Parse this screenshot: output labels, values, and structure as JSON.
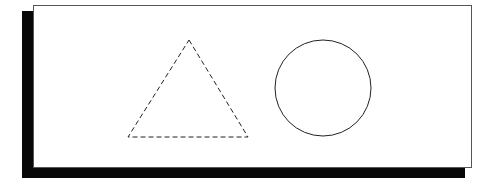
{
  "page": {
    "background_color": "#ffffff",
    "width": 496,
    "height": 187
  },
  "card": {
    "name": "white-card",
    "x": 33,
    "y": 5,
    "width": 439,
    "height": 163,
    "fill_color": "#ffffff",
    "border_color": "#555555",
    "border_width": 1
  },
  "shadow": {
    "name": "card-drop-shadow",
    "color": "#080808",
    "vertical": {
      "x": 22,
      "y": 11,
      "width": 11,
      "height": 167
    },
    "horizontal": {
      "x": 22,
      "y": 167,
      "width": 443,
      "height": 11
    }
  },
  "shapes": [
    {
      "name": "dashed-triangle",
      "type": "triangle",
      "stroke_color": "#222222",
      "stroke_width": 1,
      "stroke_style": "dashed",
      "dash_pattern": "5 3",
      "fill": "none",
      "apex_x": 189,
      "apex_y": 40,
      "base_left_x": 128,
      "base_right_x": 248,
      "base_y": 137,
      "points": "189,40 248,137 128,137"
    },
    {
      "name": "solid-circle",
      "type": "circle",
      "stroke_color": "#222222",
      "stroke_width": 1,
      "stroke_style": "solid",
      "fill": "none",
      "center_x": 323,
      "center_y": 88,
      "radius": 48
    }
  ]
}
